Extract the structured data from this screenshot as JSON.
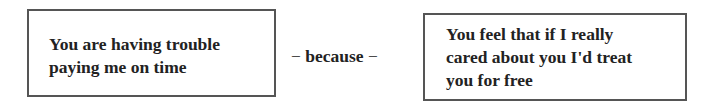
{
  "diagram": {
    "left_box": {
      "lines": [
        "You are having trouble",
        "paying me on time"
      ]
    },
    "connector": {
      "dash_left": "−",
      "label": "because",
      "dash_right": "−"
    },
    "right_box": {
      "lines": [
        "You feel that if I really",
        "cared about you I'd treat",
        "you for free"
      ]
    }
  }
}
